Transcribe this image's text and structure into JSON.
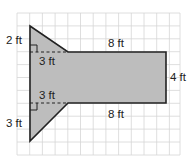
{
  "figure": {
    "colors": {
      "fill": "#bdbdbd",
      "stroke": "#222222",
      "grid": "#d4d4d4"
    },
    "labels": {
      "top_triangle_height": "2 ft",
      "top_triangle_base": "3 ft",
      "rect_top": "8 ft",
      "rect_right": "4 ft",
      "rect_bottom": "8 ft",
      "bottom_triangle_base": "3 ft",
      "bottom_triangle_height": "3 ft"
    }
  }
}
